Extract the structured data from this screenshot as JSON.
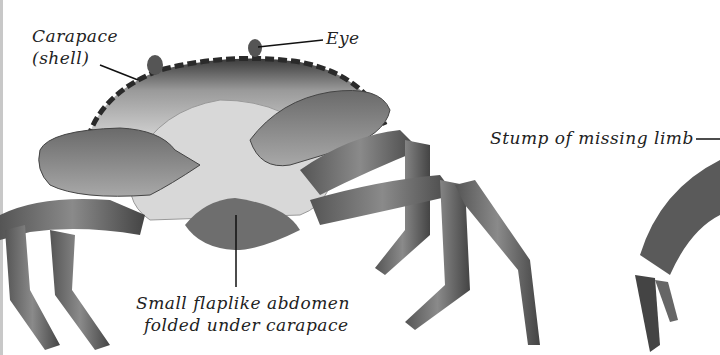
{
  "figure": {
    "labels": {
      "carapace_line1": "Carapace",
      "carapace_line2": "(shell)",
      "eye": "Eye",
      "stump": "Stump of missing limb",
      "abdomen_line1": "Small flaplike abdomen",
      "abdomen_line2": "folded under carapace"
    }
  },
  "colors": {
    "background": "#ffffff",
    "text": "#222222",
    "crab_dark": "#3a3a3a",
    "crab_mid": "#7a7a7a",
    "crab_light": "#d9d9d9"
  }
}
